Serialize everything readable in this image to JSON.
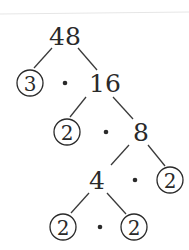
{
  "nodes": {
    "root": {
      "label": "48",
      "x": 65,
      "y": 45
    },
    "n3": {
      "label": "3",
      "x": 30,
      "y": 91,
      "circled": true
    },
    "n16": {
      "label": "16",
      "x": 105,
      "y": 91
    },
    "n2a": {
      "label": "2",
      "x": 67,
      "y": 140,
      "circled": true
    },
    "n8": {
      "label": "8",
      "x": 141,
      "y": 140
    },
    "n4": {
      "label": "4",
      "x": 97,
      "y": 188
    },
    "n2b": {
      "label": "2",
      "x": 170,
      "y": 188,
      "circled": true
    },
    "n2c": {
      "label": "2",
      "x": 63,
      "y": 235,
      "circled": true
    },
    "n2d": {
      "label": "2",
      "x": 134,
      "y": 235,
      "circled": true
    }
  },
  "multiply_symbol": "•",
  "prime_factorization": "3 • 2 • 2 • 2 • 2"
}
